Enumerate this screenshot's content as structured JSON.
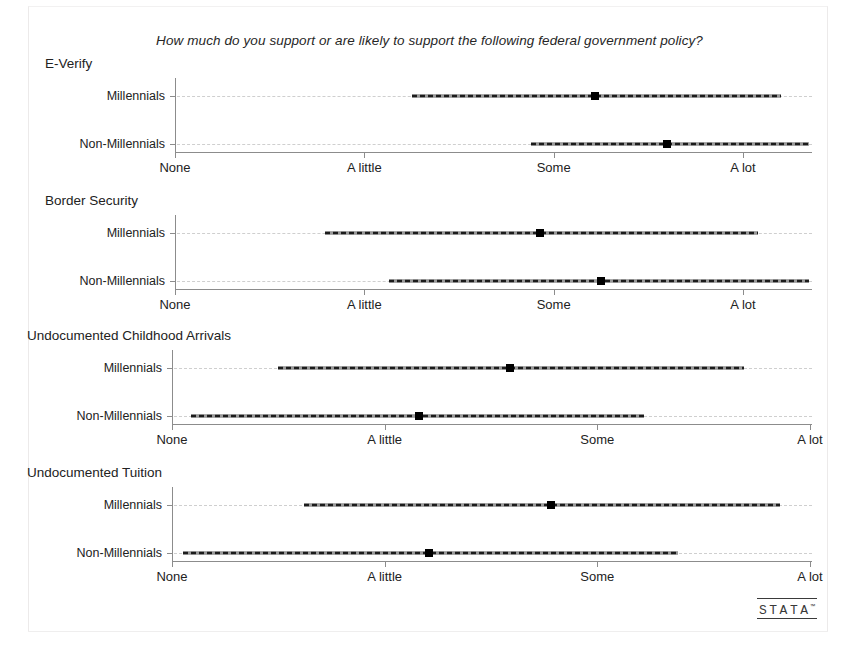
{
  "chart_data": {
    "type": "scatter",
    "title": "How much do you support or are likely to support the following federal government policy?",
    "xlabel": "",
    "ylabel": "",
    "grid": false,
    "legend": "none",
    "groups": [
      "Millennials",
      "Non-Millennials"
    ],
    "tick_labels": [
      "None",
      "A little",
      "Some",
      "A lot"
    ],
    "x_scale_note": "Categorical support scale: None=0, A little=1, Some=2, A lot=3",
    "panels": [
      {
        "title": "E-Verify",
        "xlim": [
          0,
          3
        ],
        "xticks": [
          0,
          1,
          2,
          3
        ],
        "xticklabels": [
          "None",
          "A little",
          "Some",
          "A lot"
        ],
        "rows": [
          {
            "label": "Millennials",
            "mean": 2.22,
            "ci_low": 1.25,
            "ci_high": 3.2
          },
          {
            "label": "Non-Millennials",
            "mean": 2.6,
            "ci_low": 1.88,
            "ci_high": 3.35
          }
        ]
      },
      {
        "title": "Border Security",
        "xlim": [
          0,
          3
        ],
        "xticks": [
          0,
          1,
          2,
          3
        ],
        "xticklabels": [
          "None",
          "A little",
          "Some",
          "A lot"
        ],
        "rows": [
          {
            "label": "Millennials",
            "mean": 1.93,
            "ci_low": 0.79,
            "ci_high": 3.08
          },
          {
            "label": "Non-Millennials",
            "mean": 2.25,
            "ci_low": 1.13,
            "ci_high": 3.35
          }
        ]
      },
      {
        "title": "Undocumented Childhood Arrivals",
        "xlim": [
          0,
          3
        ],
        "xticks": [
          0,
          1,
          2,
          3
        ],
        "xticklabels": [
          "None",
          "A little",
          "Some",
          "A lot"
        ],
        "rows": [
          {
            "label": "Millennials",
            "mean": 1.59,
            "ci_low": 0.5,
            "ci_high": 2.69
          },
          {
            "label": "Non-Millennials",
            "mean": 1.16,
            "ci_low": 0.09,
            "ci_high": 2.22
          }
        ]
      },
      {
        "title": "Undocumented Tuition",
        "xlim": [
          0,
          3
        ],
        "xticks": [
          0,
          1,
          2,
          3
        ],
        "xticklabels": [
          "None",
          "A little",
          "Some",
          "A lot"
        ],
        "rows": [
          {
            "label": "Millennials",
            "mean": 1.78,
            "ci_low": 0.62,
            "ci_high": 2.86
          },
          {
            "label": "Non-Millennials",
            "mean": 1.21,
            "ci_low": 0.05,
            "ci_high": 2.38
          }
        ]
      }
    ]
  },
  "footer": {
    "logo_text": "STATA",
    "logo_mark": "™"
  }
}
